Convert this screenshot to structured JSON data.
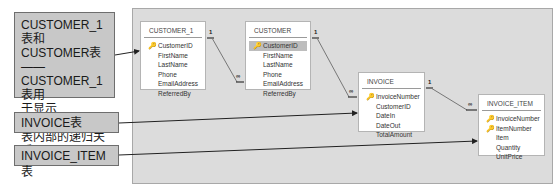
{
  "callouts": [
    {
      "id": "recursive",
      "text": "CUSTOMER_1表和CUSTOMER表——CUSTOMER_1表用于显示CUSTOMER表内部的递归关系",
      "lines": [
        "CUSTOMER_1表和",
        "CUSTOMER表——",
        "CUSTOMER_1表用",
        "于显示CUSTOMER",
        "表内部的递归关系"
      ]
    },
    {
      "id": "invoice",
      "text": "INVOICE表"
    },
    {
      "id": "invoice-item",
      "text": "INVOICE_ITEM表"
    }
  ],
  "tables": [
    {
      "name": "CUSTOMER_1",
      "fields": [
        {
          "name": "CustomerID",
          "key": true
        },
        {
          "name": "FirstName"
        },
        {
          "name": "LastName"
        },
        {
          "name": "Phone"
        },
        {
          "name": "EmailAddress"
        },
        {
          "name": "ReferredBy"
        }
      ]
    },
    {
      "name": "CUSTOMER",
      "fields": [
        {
          "name": "CustomerID",
          "key": true,
          "selected": true
        },
        {
          "name": "FirstName"
        },
        {
          "name": "LastName"
        },
        {
          "name": "Phone"
        },
        {
          "name": "EmailAddress"
        },
        {
          "name": "ReferredBy"
        }
      ]
    },
    {
      "name": "INVOICE",
      "fields": [
        {
          "name": "InvoiceNumber",
          "key": true
        },
        {
          "name": "CustomerID"
        },
        {
          "name": "DateIn"
        },
        {
          "name": "DateOut"
        },
        {
          "name": "TotalAmount"
        }
      ]
    },
    {
      "name": "INVOICE_ITEM",
      "fields": [
        {
          "name": "InvoiceNumber",
          "key": true
        },
        {
          "name": "ItemNumber",
          "key": true
        },
        {
          "name": "Item"
        },
        {
          "name": "Quantity"
        },
        {
          "name": "UnitPrice"
        }
      ]
    }
  ],
  "relationships": [
    {
      "from": "CUSTOMER_1.CustomerID",
      "to": "CUSTOMER.ReferredBy",
      "one": "1",
      "many": "∞"
    },
    {
      "from": "CUSTOMER.CustomerID",
      "to": "INVOICE.CustomerID",
      "one": "1",
      "many": "∞"
    },
    {
      "from": "INVOICE.InvoiceNumber",
      "to": "INVOICE_ITEM.InvoiceNumber",
      "one": "1",
      "many": "∞"
    }
  ],
  "symbols": {
    "key": "🔑",
    "one": "1",
    "many": "∞"
  }
}
